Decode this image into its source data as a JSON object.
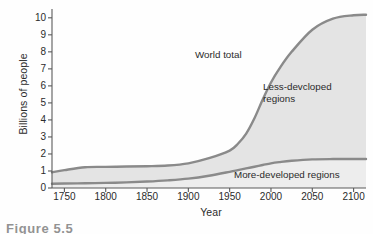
{
  "figure": {
    "caption_partial": "Figure 5.5"
  },
  "chart_data": {
    "type": "area",
    "title": "",
    "xlabel": "Year",
    "ylabel": "Billions of people",
    "xlim": [
      1735,
      2115
    ],
    "ylim": [
      0,
      10.4
    ],
    "grid": false,
    "legend_position": "inline-annotations",
    "x_ticks": [
      1750,
      1800,
      1850,
      1900,
      1950,
      2000,
      2050,
      2100
    ],
    "x_tick_labels": [
      "1750",
      "1800",
      "1850",
      "1900",
      "1950",
      "2000",
      "2050",
      "2100"
    ],
    "y_ticks": [
      0,
      1,
      2,
      3,
      4,
      5,
      6,
      7,
      8,
      9,
      10
    ],
    "y_tick_labels": [
      "0",
      "1",
      "2",
      "3",
      "4",
      "5",
      "6",
      "7",
      "8",
      "9",
      "10"
    ],
    "annotations": [
      {
        "text": "World total",
        "x": 1955,
        "y": 7.6
      },
      {
        "text": "Less-devcloped\nregions",
        "x": 2030,
        "y": 5.6
      },
      {
        "text": "More-developed regions",
        "x": 2000,
        "y": 0.75
      }
    ],
    "x": [
      1735,
      1750,
      1775,
      1800,
      1825,
      1850,
      1875,
      1900,
      1925,
      1950,
      1960,
      1970,
      1980,
      1990,
      2000,
      2010,
      2025,
      2050,
      2075,
      2100,
      2115
    ],
    "series": [
      {
        "name": "World total",
        "values": [
          0.92,
          1.05,
          1.22,
          1.24,
          1.26,
          1.28,
          1.32,
          1.45,
          1.75,
          2.2,
          2.6,
          3.2,
          4.1,
          5.2,
          6.2,
          7.0,
          8.0,
          9.3,
          9.95,
          10.15,
          10.18
        ],
        "color": "#8a8a8a"
      },
      {
        "name": "More-developed regions",
        "values": [
          0.25,
          0.26,
          0.28,
          0.3,
          0.33,
          0.38,
          0.45,
          0.55,
          0.72,
          0.95,
          1.05,
          1.15,
          1.25,
          1.35,
          1.45,
          1.52,
          1.6,
          1.68,
          1.7,
          1.7,
          1.7
        ],
        "color": "#8a8a8a"
      }
    ],
    "band": {
      "name": "Less-devcloped regions",
      "between": [
        "More-developed regions",
        "World total"
      ],
      "fill": "#e4e4e4"
    },
    "lower_fill": {
      "name": "More-developed regions area",
      "fill": "#ededed"
    },
    "colors": {
      "line": "#8a8a8a",
      "band_fill": "#e4e4e4",
      "lower_fill": "#ededed",
      "axis": "#5a5a5a",
      "text": "#2b2b2b",
      "background": "#fefefe"
    }
  }
}
